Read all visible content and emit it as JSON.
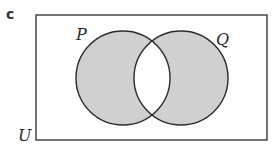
{
  "part_label": "c",
  "universal_set": {
    "label": "U"
  },
  "sets": [
    {
      "label": "P"
    },
    {
      "label": "Q"
    }
  ],
  "shaded_region": "symmetric difference (P ∪ Q) excluding (P ∩ Q)",
  "colors": {
    "shade": "#d0d0d0",
    "stroke": "#2b2b2b",
    "background": "#ffffff"
  }
}
